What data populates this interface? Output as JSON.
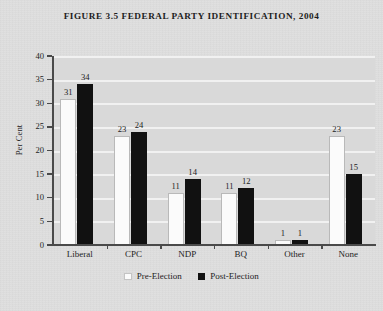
{
  "figure": {
    "title": "FIGURE 3.5 FEDERAL PARTY IDENTIFICATION, 2004"
  },
  "axes": {
    "y_title": "Per Cent",
    "y_ticks": [
      "0",
      "5",
      "10",
      "15",
      "20",
      "25",
      "30",
      "35",
      "40"
    ]
  },
  "legend": {
    "items": [
      {
        "label": "Pre-Election",
        "swatch": "light-swatch-icon",
        "color": "#fbfbfb"
      },
      {
        "label": "Post-Election",
        "swatch": "dark-swatch-icon",
        "color": "#111111"
      }
    ]
  },
  "chart_data": {
    "type": "bar",
    "title": "FIGURE 3.5 FEDERAL PARTY IDENTIFICATION, 2004",
    "xlabel": "",
    "ylabel": "Per Cent",
    "ylim": [
      0,
      40
    ],
    "ytick_step": 5,
    "grid": true,
    "legend_position": "bottom-center",
    "categories": [
      "Liberal",
      "CPC",
      "NDP",
      "BQ",
      "Other",
      "None"
    ],
    "series": [
      {
        "name": "Pre-Election",
        "color": "#fbfbfb",
        "values": [
          31,
          23,
          11,
          11,
          1,
          23
        ]
      },
      {
        "name": "Post-Election",
        "color": "#111111",
        "values": [
          34,
          24,
          14,
          12,
          1,
          15
        ]
      }
    ]
  }
}
